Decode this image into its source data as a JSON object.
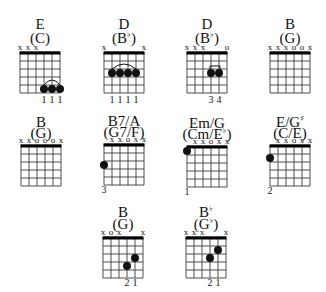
{
  "colors": {
    "ink": "#111111",
    "grid": "#3a3a3a",
    "background": "#ffffff"
  },
  "chords": [
    {
      "name": "E",
      "alt": "(C)",
      "marks": [
        "x",
        "x",
        "x",
        "",
        "",
        ""
      ],
      "dots": [
        {
          "string": 4,
          "fret": 5
        },
        {
          "string": 5,
          "fret": 5
        },
        {
          "string": 6,
          "fret": 5
        }
      ],
      "barre": {
        "from": 4,
        "to": 6,
        "fret": 5,
        "style": "arc"
      },
      "fingers": [
        "",
        "",
        "",
        "1",
        "1",
        "1"
      ]
    },
    {
      "name": "D",
      "alt": "(B♭)",
      "marks": [
        "x",
        "",
        "",
        "",
        "",
        "x"
      ],
      "dots": [
        {
          "string": 2,
          "fret": 3
        },
        {
          "string": 3,
          "fret": 3
        },
        {
          "string": 4,
          "fret": 3
        },
        {
          "string": 5,
          "fret": 3
        }
      ],
      "barre": {
        "from": 2,
        "to": 5,
        "fret": 3,
        "style": "arc"
      },
      "fingers": [
        "",
        "1",
        "1",
        "1",
        "1",
        ""
      ]
    },
    {
      "name": "D",
      "alt": "(B♭)",
      "marks": [
        "x",
        "x",
        "x",
        "",
        "",
        "o"
      ],
      "dots": [
        {
          "string": 4,
          "fret": 3
        },
        {
          "string": 5,
          "fret": 3
        }
      ],
      "barre": {
        "from": 4,
        "to": 5,
        "fret": 3,
        "style": "bracket"
      },
      "fingers": [
        "",
        "",
        "",
        "3",
        "4",
        ""
      ]
    },
    {
      "name": "B",
      "alt": "(G)",
      "marks": [
        "x",
        "x",
        "x",
        "o",
        "o",
        "x"
      ],
      "dots": [],
      "barre": null,
      "fingers": [
        "",
        "",
        "",
        "",
        "",
        ""
      ]
    },
    {
      "name": "B",
      "alt": "(G)",
      "marks": [
        "x",
        "x",
        "o",
        "o",
        "o",
        "x"
      ],
      "dots": [],
      "barre": null,
      "fingers": [
        "",
        "",
        "",
        "",
        "",
        ""
      ]
    },
    {
      "name": "B7/A",
      "alt": "(G7/F)",
      "marks": [
        "",
        "x",
        "x",
        "o",
        "x",
        "x"
      ],
      "dots": [
        {
          "string": 1,
          "fret": 3
        }
      ],
      "barre": null,
      "fingers": [
        "3",
        "",
        "",
        "",
        "",
        ""
      ]
    },
    {
      "name": "Em/G",
      "alt": "(Cm/E♭)",
      "marks": [
        "",
        "x",
        "x",
        "o",
        "x",
        "x"
      ],
      "dots": [
        {
          "string": 1,
          "fret": 1
        }
      ],
      "barre": null,
      "fingers": [
        "1",
        "",
        "",
        "",
        "",
        ""
      ]
    },
    {
      "name": "E/G♯",
      "alt": "(C/E)",
      "marks": [
        "",
        "x",
        "x",
        "o",
        "x",
        "x"
      ],
      "dots": [
        {
          "string": 1,
          "fret": 2
        }
      ],
      "barre": null,
      "fingers": [
        "2",
        "",
        "",
        "",
        "",
        ""
      ]
    },
    {
      "name": "B",
      "alt": "(G)",
      "marks": [
        "x",
        "o",
        "x",
        "",
        "",
        "x"
      ],
      "dots": [
        {
          "string": 4,
          "fret": 4
        },
        {
          "string": 5,
          "fret": 3
        }
      ],
      "barre": null,
      "fingers": [
        "",
        "",
        "",
        "2",
        "1",
        ""
      ]
    },
    {
      "name": "B♭",
      "alt": "(G♭)",
      "marks": [
        "x",
        "x",
        "x",
        "",
        "",
        "x"
      ],
      "dots": [
        {
          "string": 4,
          "fret": 3
        },
        {
          "string": 5,
          "fret": 2
        }
      ],
      "barre": null,
      "fingers": [
        "",
        "",
        "",
        "2",
        "1",
        ""
      ]
    }
  ]
}
